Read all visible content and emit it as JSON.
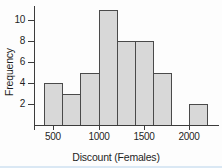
{
  "chart_data": {
    "type": "bar",
    "subtype": "histogram",
    "title": "",
    "xlabel": "Discount (Females)",
    "ylabel": "Frequency",
    "bin_edges": [
      400,
      600,
      800,
      1000,
      1200,
      1400,
      1600,
      1800,
      2000,
      2200
    ],
    "frequencies": [
      4,
      3,
      5,
      11,
      8,
      8,
      5,
      0,
      2
    ],
    "xticks": [
      500,
      1000,
      1500,
      2000
    ],
    "yticks": [
      2,
      4,
      6,
      8,
      10
    ],
    "xlim": [
      300,
      2320
    ],
    "ylim": [
      0,
      11.3
    ],
    "grid": false,
    "legend": "none",
    "bar_fill": "#d8d8d8",
    "bar_border": "#4a4a4a",
    "axis_color": "#3c3c3c"
  }
}
